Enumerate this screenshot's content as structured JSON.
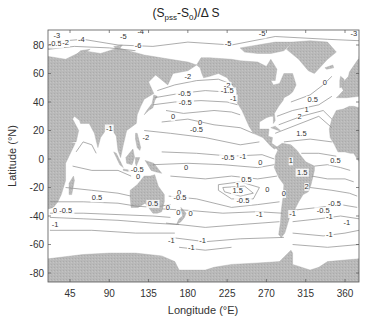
{
  "chart_data": {
    "type": "contour",
    "title_parts": {
      "lead": "(S",
      "sub1": "pss",
      "mid": "-S",
      "sub2": "0",
      "tail": ")/Δ S"
    },
    "xlabel": "Longitude (°E)",
    "ylabel": "Latitude (°N)",
    "x_ticks": [
      45,
      90,
      135,
      180,
      225,
      270,
      315,
      360
    ],
    "y_ticks": [
      80,
      60,
      40,
      20,
      0,
      -20,
      -40,
      -60,
      -80
    ],
    "xlim": [
      20,
      376
    ],
    "ylim": [
      -87,
      90
    ],
    "grid": false,
    "land_color": "#b8b8b8",
    "ocean_color": "#ffffff",
    "contour_color": "#888888",
    "contour_levels": [
      -5,
      -4,
      -3,
      -2,
      -1.5,
      -1,
      -0.5,
      0,
      0.5,
      1,
      1.5,
      2
    ],
    "contour_labels": [
      {
        "text": "-3",
        "lon": 30,
        "lat": 85
      },
      {
        "text": "-4",
        "lon": 126,
        "lat": 88
      },
      {
        "text": "-4",
        "lon": 58,
        "lat": 82
      },
      {
        "text": "-0.5",
        "lon": 28,
        "lat": 79
      },
      {
        "text": "-2",
        "lon": 40,
        "lat": 80
      },
      {
        "text": "-5",
        "lon": 106,
        "lat": 84
      },
      {
        "text": "-6",
        "lon": 123,
        "lat": 78
      },
      {
        "text": "-5",
        "lon": 226,
        "lat": 79
      },
      {
        "text": "-5",
        "lon": 265,
        "lat": 86
      },
      {
        "text": "-3",
        "lon": 370,
        "lat": 86
      },
      {
        "text": "-2",
        "lon": 180,
        "lat": 56
      },
      {
        "text": "-2",
        "lon": 225,
        "lat": 50
      },
      {
        "text": "-1.5",
        "lon": 225,
        "lat": 46
      },
      {
        "text": "-1",
        "lon": 232,
        "lat": 41
      },
      {
        "text": "-0.5",
        "lon": 176,
        "lat": 44
      },
      {
        "text": "0.5",
        "lon": 323,
        "lat": 40
      },
      {
        "text": "0",
        "lon": 337,
        "lat": 52
      },
      {
        "text": "1",
        "lon": 316,
        "lat": 33
      },
      {
        "text": "-0.5",
        "lon": 177,
        "lat": 38
      },
      {
        "text": "0",
        "lon": 163,
        "lat": 28
      },
      {
        "text": "0",
        "lon": 194,
        "lat": 24
      },
      {
        "text": "-0.5",
        "lon": 190,
        "lat": 19
      },
      {
        "text": "2",
        "lon": 308,
        "lat": 28
      },
      {
        "text": "1.5",
        "lon": 310,
        "lat": 16
      },
      {
        "text": "-1",
        "lon": 90,
        "lat": 20
      },
      {
        "text": "-2",
        "lon": 132,
        "lat": 13
      },
      {
        "text": "-0.5",
        "lon": 122,
        "lat": -9
      },
      {
        "text": "0",
        "lon": 123,
        "lat": -14
      },
      {
        "text": "-0.5",
        "lon": 226,
        "lat": -1
      },
      {
        "text": "-1",
        "lon": 243,
        "lat": 0
      },
      {
        "text": "0",
        "lon": 263,
        "lat": -4
      },
      {
        "text": "0",
        "lon": 178,
        "lat": -8
      },
      {
        "text": "0",
        "lon": 170,
        "lat": -25
      },
      {
        "text": "0.5",
        "lon": 247,
        "lat": -16
      },
      {
        "text": "1",
        "lon": 237,
        "lat": -20
      },
      {
        "text": "1.5",
        "lon": 237,
        "lat": -24
      },
      {
        "text": "1",
        "lon": 298,
        "lat": -3
      },
      {
        "text": "1.5",
        "lon": 311,
        "lat": -11
      },
      {
        "text": "0.5",
        "lon": 349,
        "lat": -3
      },
      {
        "text": "2",
        "lon": 316,
        "lat": -21
      },
      {
        "text": "0",
        "lon": 271,
        "lat": -23
      },
      {
        "text": "0",
        "lon": 290,
        "lat": -26
      },
      {
        "text": "0.5",
        "lon": 76,
        "lat": -29
      },
      {
        "text": "0.5",
        "lon": 140,
        "lat": -33
      },
      {
        "text": "0",
        "lon": 157,
        "lat": -36
      },
      {
        "text": "0",
        "lon": 28,
        "lat": -38
      },
      {
        "text": "-0.5",
        "lon": 40,
        "lat": -38
      },
      {
        "text": "-1",
        "lon": 28,
        "lat": -48
      },
      {
        "text": "-0.5",
        "lon": 171,
        "lat": -29
      },
      {
        "text": "0",
        "lon": 169,
        "lat": -39
      },
      {
        "text": "0",
        "lon": 183,
        "lat": -40
      },
      {
        "text": "-0.5",
        "lon": 243,
        "lat": -31
      },
      {
        "text": "-1",
        "lon": 262,
        "lat": -41
      },
      {
        "text": "-1",
        "lon": 197,
        "lat": -59
      },
      {
        "text": "-1",
        "lon": 184,
        "lat": -64
      },
      {
        "text": "-1",
        "lon": 161,
        "lat": -59
      },
      {
        "text": "-0.5",
        "lon": 348,
        "lat": -33
      },
      {
        "text": "-0.5",
        "lon": 335,
        "lat": -38
      },
      {
        "text": "-1",
        "lon": 342,
        "lat": -42
      },
      {
        "text": "-1",
        "lon": 342,
        "lat": -55
      },
      {
        "text": "-1",
        "lon": 300,
        "lat": -40
      },
      {
        "text": "-1",
        "lon": 362,
        "lat": -46
      }
    ]
  },
  "axes": {
    "x_tick_labels": [
      "45",
      "90",
      "135",
      "180",
      "225",
      "270",
      "315",
      "360"
    ],
    "y_tick_labels": [
      "80",
      "60",
      "40",
      "20",
      "0",
      "-20",
      "-40",
      "-60",
      "-80"
    ]
  }
}
